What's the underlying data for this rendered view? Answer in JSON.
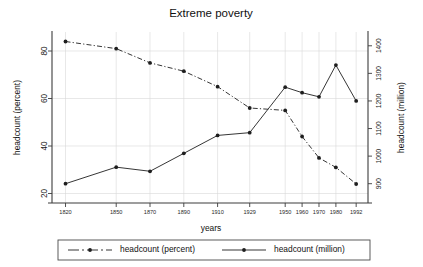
{
  "chart_data": {
    "type": "line",
    "title": "Extreme poverty",
    "xlabel": "years",
    "ylabel": "headcount (percent)",
    "y2label": "headcount (million)",
    "categories": [
      "1820",
      "1850",
      "1870",
      "1890",
      "1910",
      "1929",
      "1950",
      "1960",
      "1970",
      "1980",
      "1992"
    ],
    "x_tick_labels": [
      "1820",
      "1850",
      "1870",
      "1890",
      "1910",
      "1929",
      "1950",
      "1960",
      "1970",
      "1980",
      "1992"
    ],
    "y_tick_labels": [
      "20",
      "40",
      "60",
      "80"
    ],
    "y_ticks": [
      20,
      40,
      60,
      80
    ],
    "ylim": [
      16,
      88
    ],
    "y2_tick_labels": [
      "900",
      "1000",
      "1100",
      "1200",
      "1300",
      "1400"
    ],
    "y2_ticks": [
      900,
      1000,
      1100,
      1200,
      1300,
      1400
    ],
    "y2lim": [
      830,
      1450
    ],
    "grid": true,
    "legend_position": "bottom",
    "series": [
      {
        "name": "headcount (percent)",
        "axis": "left",
        "style": "dashed",
        "color": "#2b2b2b",
        "values": [
          84,
          81,
          75,
          71.5,
          65,
          56,
          55,
          44,
          35,
          31,
          24
        ]
      },
      {
        "name": "headcount (million)",
        "axis": "right",
        "style": "solid",
        "color": "#2b2b2b",
        "values": [
          900,
          960,
          945,
          1010,
          1075,
          1085,
          1250,
          1230,
          1215,
          1330,
          1200
        ]
      }
    ],
    "legend": [
      {
        "label": "headcount (percent)",
        "style": "dashed"
      },
      {
        "label": "headcount (million)",
        "style": "solid"
      }
    ]
  }
}
